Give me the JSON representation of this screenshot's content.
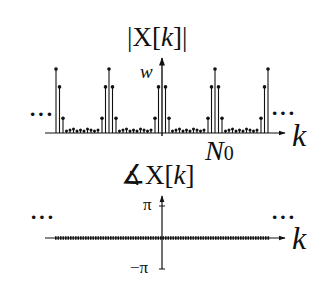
{
  "figure": {
    "magnitude_plot": {
      "title_prefix": "|X[",
      "title_var": "k",
      "title_suffix": "]|",
      "y_label": "w",
      "x_label": "k",
      "marker_label_main": "N",
      "marker_label_sub": "0",
      "left_ellipsis": "···",
      "right_ellipsis": "···"
    },
    "phase_plot": {
      "title_angle": "∡",
      "title_prefix": "X[",
      "title_var": "k",
      "title_suffix": "]",
      "y_top_label": "π",
      "y_bottom_label": "−π",
      "x_label": "k",
      "left_ellipsis": "···",
      "right_ellipsis": "···"
    },
    "colors": {
      "ink": "#111111",
      "background": "#ffffff"
    }
  },
  "chart_data": [
    {
      "type": "stem",
      "title": "|X[k]|",
      "xlabel": "k",
      "ylabel": "w",
      "x_marker": "N0",
      "period": "N0",
      "description": "Periodic magnitude spectrum: clusters of peaks at k = ..., -2N0, -N0, 0, N0, 2N0, ...; each cluster peaks at w with decaying neighbors, near-zero values between clusters",
      "cluster_centers_k": [
        "-2N0",
        "-N0",
        "0",
        "N0",
        "2N0"
      ],
      "cluster_shape": {
        "offsets": [
          -2,
          -1,
          0,
          1,
          2
        ],
        "relative_heights": [
          0.23,
          0.72,
          1.0,
          0.72,
          0.23
        ]
      },
      "peak_value": "w",
      "between_clusters": "small (~0.03w) values",
      "legend": []
    },
    {
      "type": "stem",
      "title": "∡X[k]",
      "xlabel": "k",
      "yticks": [
        "π",
        "−π"
      ],
      "ylim": [
        "-π",
        "π"
      ],
      "description": "Phase is zero for all k",
      "values": "0 for all k"
    }
  ]
}
